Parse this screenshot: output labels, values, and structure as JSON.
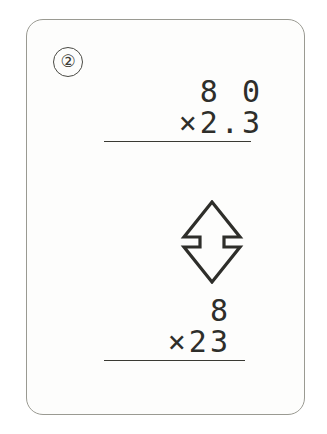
{
  "card": {
    "problem_number": "②"
  },
  "top_expression": {
    "operand": "8 0",
    "multiplier": "×2.3",
    "rule": "horizontal-rule"
  },
  "arrow": {
    "icon": "double-headed-vertical-arrow",
    "meaning": "equivalent-to"
  },
  "bottom_expression": {
    "operand": "8",
    "multiplier": "×23",
    "rule": "horizontal-rule"
  },
  "colors": {
    "ink": "#2e2e2a",
    "card_border": "#9a9a92",
    "card_fill": "#fdfdfc",
    "page_background": "#ffffff"
  }
}
